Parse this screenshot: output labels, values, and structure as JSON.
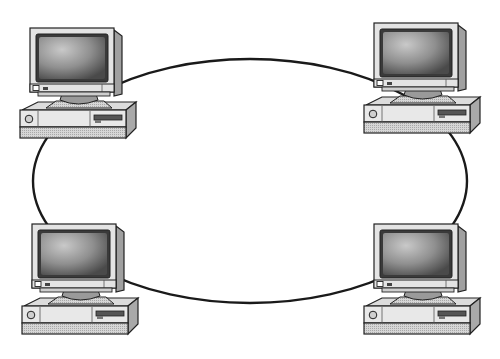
{
  "diagram": {
    "type": "ring-network-topology",
    "title": "",
    "ring": {
      "cx": 250,
      "cy": 181,
      "rx": 217,
      "ry": 122,
      "stroke": "#1a1a1a",
      "stroke_width": 2.4
    },
    "nodes": [
      {
        "id": "computer-top-left",
        "x": 16,
        "y": 24,
        "label": ""
      },
      {
        "id": "computer-top-right",
        "x": 360,
        "y": 19,
        "label": ""
      },
      {
        "id": "computer-bottom-left",
        "x": 18,
        "y": 220,
        "label": ""
      },
      {
        "id": "computer-bottom-right",
        "x": 360,
        "y": 220,
        "label": ""
      }
    ],
    "connections": [
      [
        "computer-top-left",
        "computer-top-right"
      ],
      [
        "computer-top-right",
        "computer-bottom-right"
      ],
      [
        "computer-bottom-right",
        "computer-bottom-left"
      ],
      [
        "computer-bottom-left",
        "computer-top-left"
      ]
    ],
    "colors": {
      "background": "#ffffff",
      "outline": "#222222",
      "case_light": "#e6e6e6",
      "case_mid": "#c8c8c8",
      "case_dark": "#9a9a9a",
      "screen_dark": "#4a4a4a",
      "screen_light": "#bdbdbd"
    }
  }
}
